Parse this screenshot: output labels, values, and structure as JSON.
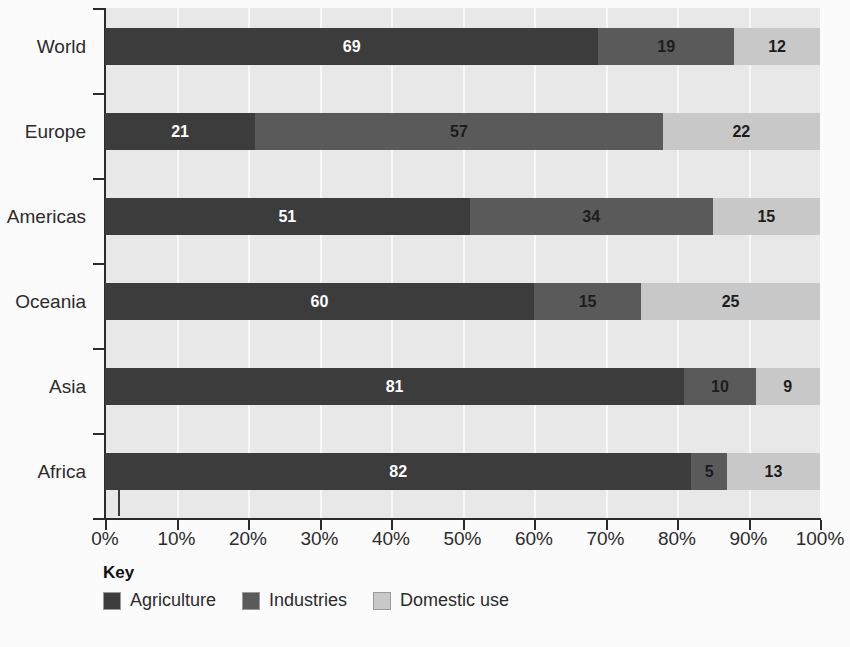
{
  "chart_data": {
    "type": "bar",
    "orientation": "horizontal",
    "stacked": true,
    "stack_mode": "percent",
    "title": "",
    "xlabel": "",
    "ylabel": "",
    "xlim": [
      0,
      100
    ],
    "grid": true,
    "legend_position": "bottom-left",
    "categories": [
      "World",
      "Europe",
      "Americas",
      "Oceania",
      "Asia",
      "Africa"
    ],
    "x_tick_labels": [
      "0%",
      "10%",
      "20%",
      "30%",
      "40%",
      "50%",
      "60%",
      "70%",
      "80%",
      "90%",
      "100%"
    ],
    "x_tick_values": [
      0,
      10,
      20,
      30,
      40,
      50,
      60,
      70,
      80,
      90,
      100
    ],
    "series": [
      {
        "name": "Agriculture",
        "values": [
          69,
          21,
          51,
          60,
          81,
          82
        ]
      },
      {
        "name": "Industries",
        "values": [
          19,
          57,
          34,
          15,
          10,
          5
        ]
      },
      {
        "name": "Domestic use",
        "values": [
          12,
          22,
          15,
          25,
          9,
          13
        ]
      }
    ],
    "rows": [
      {
        "category": "World",
        "segments": [
          {
            "series": "Agriculture",
            "value": 69,
            "label": "69",
            "label_color": "light"
          },
          {
            "series": "Industries",
            "value": 19,
            "label": "19",
            "label_color": "dark"
          },
          {
            "series": "Domestic use",
            "value": 12,
            "label": "12",
            "label_color": "dark"
          }
        ]
      },
      {
        "category": "Europe",
        "segments": [
          {
            "series": "Agriculture",
            "value": 21,
            "label": "21",
            "label_color": "light"
          },
          {
            "series": "Industries",
            "value": 57,
            "label": "57",
            "label_color": "dark"
          },
          {
            "series": "Domestic use",
            "value": 22,
            "label": "22",
            "label_color": "dark"
          }
        ]
      },
      {
        "category": "Americas",
        "segments": [
          {
            "series": "Agriculture",
            "value": 51,
            "label": "51",
            "label_color": "light"
          },
          {
            "series": "Industries",
            "value": 34,
            "label": "34",
            "label_color": "dark"
          },
          {
            "series": "Domestic use",
            "value": 15,
            "label": "15",
            "label_color": "dark"
          }
        ]
      },
      {
        "category": "Oceania",
        "segments": [
          {
            "series": "Agriculture",
            "value": 60,
            "label": "60",
            "label_color": "light"
          },
          {
            "series": "Industries",
            "value": 15,
            "label": "15",
            "label_color": "dark"
          },
          {
            "series": "Domestic use",
            "value": 25,
            "label": "25",
            "label_color": "dark"
          }
        ]
      },
      {
        "category": "Asia",
        "segments": [
          {
            "series": "Agriculture",
            "value": 81,
            "label": "81",
            "label_color": "light"
          },
          {
            "series": "Industries",
            "value": 10,
            "label": "10",
            "label_color": "dark"
          },
          {
            "series": "Domestic use",
            "value": 9,
            "label": "9",
            "label_color": "dark"
          }
        ]
      },
      {
        "category": "Africa",
        "segments": [
          {
            "series": "Agriculture",
            "value": 82,
            "label": "82",
            "label_color": "light"
          },
          {
            "series": "Industries",
            "value": 5,
            "label": "5",
            "label_color": "dark"
          },
          {
            "series": "Domestic use",
            "value": 13,
            "label": "13",
            "label_color": "dark"
          }
        ]
      }
    ]
  },
  "legend": {
    "title": "Key",
    "items": [
      {
        "label": "Agriculture",
        "color": "#3c3c3c"
      },
      {
        "label": "Industries",
        "color": "#5a5a5a"
      },
      {
        "label": "Domestic use",
        "color": "#c8c8c8"
      }
    ]
  },
  "colors": {
    "agriculture": "#3c3c3c",
    "industries": "#5a5a5a",
    "domestic_use": "#c8c8c8",
    "plot_background": "#e8e8e8",
    "page_background": "#fbfbfb",
    "gridline": "#f7f7f7",
    "axis": "#2b2b2b",
    "text": "#2b2b2b"
  }
}
